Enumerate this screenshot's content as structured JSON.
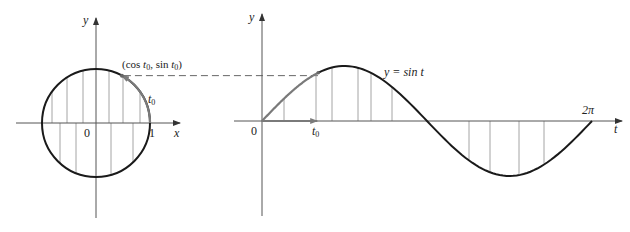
{
  "figure": {
    "left_panel": {
      "name": "unit-circle",
      "labels": {
        "y_axis": "y",
        "x_axis": "x",
        "origin": "0",
        "one": "1",
        "point_prefix": "(cos ",
        "point_t": "t",
        "point_sub": "0",
        "point_mid": ", sin ",
        "point_t2": "t",
        "point_sub2": "0",
        "point_suffix": ")",
        "arc_t": "t",
        "arc_sub": "0"
      }
    },
    "right_panel": {
      "name": "sine-graph",
      "labels": {
        "y_axis": "y",
        "t_axis": "t",
        "origin": "0",
        "t0_t": "t",
        "t0_sub": "0",
        "two_pi": "2π",
        "curve_prefix": "y = sin ",
        "curve_t": "t"
      }
    },
    "colors": {
      "curve": "#1a1a1a",
      "axis": "#555555",
      "highlight": "#7a7a7a",
      "hatch": "#9a9a9a",
      "dash": "#666666"
    }
  },
  "chart_data": {
    "type": "line",
    "title": "",
    "panels": [
      {
        "name": "unit circle",
        "xlabel": "x",
        "ylabel": "y",
        "circle": {
          "center": [
            0,
            0
          ],
          "radius": 1
        },
        "marked_point": {
          "label": "(cos t0, sin t0)",
          "angle_t0_rad": 1.07,
          "x": 0.48,
          "y": 0.88
        },
        "tick_labels": [
          "0",
          "1"
        ],
        "arc_label": "t0"
      },
      {
        "name": "sine graph",
        "xlabel": "t",
        "ylabel": "y",
        "curve_label": "y = sin t",
        "xlim": [
          0,
          6.2832
        ],
        "ylim": [
          -1,
          1
        ],
        "tick_labels": [
          "0",
          "t0",
          "2π"
        ],
        "x": [
          0,
          0.7854,
          1.5708,
          2.3562,
          3.1416,
          3.927,
          4.7124,
          5.4978,
          6.2832
        ],
        "y": [
          0,
          0.707,
          1,
          0.707,
          0,
          -0.707,
          -1,
          -0.707,
          0
        ],
        "marked_point": {
          "t": 1.07,
          "y": 0.88,
          "label": "t0"
        }
      }
    ],
    "grid": false,
    "legend": "none"
  }
}
